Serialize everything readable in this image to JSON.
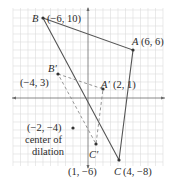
{
  "diagram": {
    "type": "coordinate-plane dilation",
    "grid": {
      "x_min": -10,
      "x_max": 10,
      "y_min": -11,
      "y_max": 11,
      "color": "#d9d9d9",
      "axis_color": "#666666"
    },
    "original_triangle": {
      "style": "solid",
      "color": "#555555",
      "vertices": [
        {
          "name": "A",
          "label": "A",
          "coords": "(6, 6)",
          "x": 6,
          "y": 6
        },
        {
          "name": "B",
          "label": "B",
          "coords": "(−6, 10)",
          "x": -6,
          "y": 10
        },
        {
          "name": "C",
          "label": "C",
          "coords": "(4, −8)",
          "x": 4,
          "y": -8
        }
      ]
    },
    "image_triangle": {
      "style": "dashed",
      "color": "#777777",
      "vertices": [
        {
          "name": "A'",
          "label": "A′",
          "coords": "(2, 1)",
          "x": 2,
          "y": 1
        },
        {
          "name": "B'",
          "label": "B′",
          "coords": "(−4, 3)",
          "x": -4,
          "y": 3
        },
        {
          "name": "C'",
          "label": "C′",
          "coords": "(1, −6)",
          "x": 1,
          "y": -6
        }
      ]
    },
    "center": {
      "coords": "(−2, −4)",
      "line1": "center of",
      "line2": "dilation",
      "x": -2,
      "y": -4
    }
  }
}
